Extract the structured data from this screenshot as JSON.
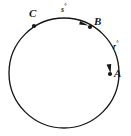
{
  "figure": {
    "type": "circle-with-arcs",
    "background_color": "#ffffff",
    "stroke_color": "#171717",
    "circle": {
      "center_x": 64,
      "center_y": 73,
      "radius": 55,
      "stroke_width": 1.3
    },
    "points": [
      {
        "id": "A",
        "label": "A",
        "x": 110,
        "y": 74,
        "marker": "dot"
      },
      {
        "id": "B",
        "label": "B",
        "x": 90,
        "y": 27,
        "marker": "dot"
      },
      {
        "id": "C",
        "label": "C",
        "x": 34,
        "y": 26,
        "marker": "dot"
      }
    ],
    "arc_labels": [
      {
        "id": "s",
        "variable": "s",
        "degree_symbol": "°",
        "arc_from": "C",
        "arc_to": "B",
        "x": 61,
        "y": 3
      },
      {
        "id": "r",
        "variable": "r",
        "degree_symbol": "°",
        "arc_from": "B",
        "arc_to": "A",
        "x": 113,
        "y": 40
      }
    ],
    "arrowheads": [
      {
        "id": "arrow-s",
        "on_arc": "C-to-B",
        "x": 84,
        "y": 23,
        "direction": "clockwise"
      },
      {
        "id": "arrow-r",
        "on_arc": "B-to-A",
        "x": 110,
        "y": 70,
        "direction": "clockwise"
      }
    ]
  }
}
